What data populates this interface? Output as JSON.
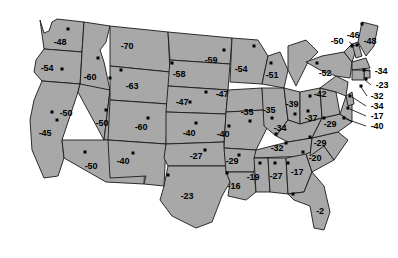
{
  "map": {
    "title": "United States state value map",
    "colors": {
      "state_fill": "#a8a8a8",
      "state_border": "#1a1a1a",
      "label_text": "#000000",
      "background": "#ffffff",
      "marker": "#000000"
    },
    "value_prefix": "",
    "states": [
      {
        "code": "WA",
        "label": "-48",
        "value": -48,
        "lx": 60,
        "ly": 42,
        "dx": 68,
        "dy": 29
      },
      {
        "code": "OR",
        "label": "-54",
        "value": -54,
        "lx": 47,
        "ly": 68,
        "dx": 62,
        "dy": 69
      },
      {
        "code": "ID",
        "label": "-60",
        "value": -60,
        "lx": 90,
        "ly": 77,
        "dx": 98,
        "dy": 58
      },
      {
        "code": "MT",
        "label": "-70",
        "value": -70,
        "lx": 127,
        "ly": 46,
        "dx": 110,
        "dy": 78
      },
      {
        "code": "ND",
        "label": "-59",
        "value": -59,
        "lx": 211,
        "ly": 60,
        "dx": 224,
        "dy": 50
      },
      {
        "code": "MN",
        "label": "-54",
        "value": -54,
        "lx": 241,
        "ly": 69,
        "dx": 254,
        "dy": 46
      },
      {
        "code": "WY",
        "label": "-63",
        "value": -63,
        "lx": 132,
        "ly": 86,
        "dx": 121,
        "dy": 70
      },
      {
        "code": "SD",
        "label": "-58",
        "value": -58,
        "lx": 179,
        "ly": 74,
        "dx": 172,
        "dy": 63
      },
      {
        "code": "NE",
        "label": "-47",
        "value": -47,
        "lx": 182,
        "ly": 102,
        "dx": 190,
        "dy": 102
      },
      {
        "code": "IA",
        "label": "-47",
        "value": -47,
        "lx": 222,
        "ly": 94,
        "dx": 206,
        "dy": 92
      },
      {
        "code": "WI",
        "label": "-51",
        "value": -51,
        "lx": 272,
        "ly": 75,
        "dx": 271,
        "dy": 63
      },
      {
        "code": "MI",
        "label": "-51",
        "value": -51,
        "lx": 272,
        "ly": 75,
        "dx": 271,
        "dy": 63
      },
      {
        "code": "NV",
        "label": "-50",
        "value": -50,
        "lx": 66,
        "ly": 113,
        "dx": 52,
        "dy": 112
      },
      {
        "code": "UT",
        "label": "-50",
        "value": -50,
        "lx": 102,
        "ly": 123,
        "dx": 106,
        "dy": 110
      },
      {
        "code": "CA",
        "label": "-45",
        "value": -45,
        "lx": 45,
        "ly": 133,
        "dx": 57,
        "dy": 120
      },
      {
        "code": "CO",
        "label": "-60",
        "value": -60,
        "lx": 141,
        "ly": 127,
        "dx": 148,
        "dy": 118
      },
      {
        "code": "KS",
        "label": "-40",
        "value": -40,
        "lx": 189,
        "ly": 133,
        "dx": 196,
        "dy": 123
      },
      {
        "code": "MO",
        "label": "-40",
        "value": -40,
        "lx": 223,
        "ly": 134,
        "dx": 229,
        "dy": 126
      },
      {
        "code": "IL",
        "label": "-35",
        "value": -35,
        "lx": 247,
        "ly": 112,
        "dx": 250,
        "dy": 121
      },
      {
        "code": "IN",
        "label": "-35",
        "value": -35,
        "lx": 269,
        "ly": 110,
        "dx": 272,
        "dy": 118
      },
      {
        "code": "OH",
        "label": "-39",
        "value": -39,
        "lx": 292,
        "ly": 104,
        "dx": 295,
        "dy": 114
      },
      {
        "code": "PA",
        "label": "-42",
        "value": -42,
        "lx": 320,
        "ly": 94,
        "dx": 310,
        "dy": 96
      },
      {
        "code": "NY",
        "label": "-52",
        "value": -52,
        "lx": 325,
        "ly": 73,
        "dx": 317,
        "dy": 63
      },
      {
        "code": "VT",
        "label": "-50",
        "value": -50,
        "lx": 337,
        "ly": 41,
        "dx": 352,
        "dy": 46
      },
      {
        "code": "NH",
        "label": "-46",
        "value": -46,
        "lx": 353,
        "ly": 35,
        "dx": 357,
        "dy": 45
      },
      {
        "code": "ME",
        "label": "-48",
        "value": -48,
        "lx": 370,
        "ly": 41,
        "dx": 362,
        "dy": 24
      },
      {
        "code": "MA",
        "label": "-34",
        "value": -34,
        "lx": 381,
        "ly": 71,
        "dx": 364,
        "dy": 70
      },
      {
        "code": "RI",
        "label": "-23",
        "value": -23,
        "lx": 382,
        "ly": 85,
        "dx": 366,
        "dy": 79
      },
      {
        "code": "CT",
        "label": "-32",
        "value": -32,
        "lx": 377,
        "ly": 96,
        "dx": 361,
        "dy": 86
      },
      {
        "code": "NJ",
        "label": "-34",
        "value": -34,
        "lx": 377,
        "ly": 106,
        "dx": 350,
        "dy": 96
      },
      {
        "code": "DE",
        "label": "-17",
        "value": -17,
        "lx": 377,
        "ly": 116,
        "dx": 348,
        "dy": 108
      },
      {
        "code": "MD",
        "label": "-40",
        "value": -40,
        "lx": 377,
        "ly": 126,
        "dx": 344,
        "dy": 118
      },
      {
        "code": "WV",
        "label": "-37",
        "value": -37,
        "lx": 311,
        "ly": 118,
        "dx": 308,
        "dy": 111
      },
      {
        "code": "VA",
        "label": "-29",
        "value": -29,
        "lx": 330,
        "ly": 124,
        "dx": 324,
        "dy": 118
      },
      {
        "code": "KY",
        "label": "-34",
        "value": -34,
        "lx": 280,
        "ly": 128,
        "dx": 276,
        "dy": 134
      },
      {
        "code": "TN",
        "label": "-32",
        "value": -32,
        "lx": 277,
        "ly": 148,
        "dx": 286,
        "dy": 143
      },
      {
        "code": "NC",
        "label": "-29",
        "value": -29,
        "lx": 320,
        "ly": 143,
        "dx": 310,
        "dy": 137
      },
      {
        "code": "SC",
        "label": "-20",
        "value": -20,
        "lx": 315,
        "ly": 158,
        "dx": 303,
        "dy": 152
      },
      {
        "code": "OK",
        "label": "-27",
        "value": -27,
        "lx": 196,
        "ly": 156,
        "dx": 205,
        "dy": 150
      },
      {
        "code": "AR",
        "label": "-29",
        "value": -29,
        "lx": 232,
        "ly": 161,
        "dx": 239,
        "dy": 155
      },
      {
        "code": "MS",
        "label": "-19",
        "value": -19,
        "lx": 253,
        "ly": 177,
        "dx": 260,
        "dy": 163
      },
      {
        "code": "AL",
        "label": "-27",
        "value": -27,
        "lx": 276,
        "ly": 176,
        "dx": 275,
        "dy": 163
      },
      {
        "code": "GA",
        "label": "-17",
        "value": -17,
        "lx": 297,
        "ly": 172,
        "dx": 288,
        "dy": 163
      },
      {
        "code": "LA",
        "label": "-16",
        "value": -16,
        "lx": 234,
        "ly": 186,
        "dx": 227,
        "dy": 173
      },
      {
        "code": "FL",
        "label": "-2",
        "value": -2,
        "lx": 320,
        "ly": 211,
        "dx": 293,
        "dy": 194
      },
      {
        "code": "TX",
        "label": "-23",
        "value": -23,
        "lx": 187,
        "ly": 196,
        "dx": 168,
        "dy": 175
      },
      {
        "code": "NM",
        "label": "-40",
        "value": -40,
        "lx": 123,
        "ly": 161,
        "dx": 133,
        "dy": 153
      },
      {
        "code": "AZ",
        "label": "-50",
        "value": -50,
        "lx": 91,
        "ly": 166,
        "dx": 85,
        "dy": 152
      }
    ],
    "leaders": [
      {
        "x1": 355,
        "y1": 46,
        "x2": 349,
        "y2": 42
      },
      {
        "x1": 370,
        "y1": 71,
        "x2": 363,
        "y2": 70
      },
      {
        "x1": 371,
        "y1": 85,
        "x2": 365,
        "y2": 80
      },
      {
        "x1": 367,
        "y1": 96,
        "x2": 361,
        "y2": 87
      },
      {
        "x1": 366,
        "y1": 106,
        "x2": 352,
        "y2": 97
      },
      {
        "x1": 366,
        "y1": 116,
        "x2": 350,
        "y2": 109
      },
      {
        "x1": 366,
        "y1": 126,
        "x2": 346,
        "y2": 119
      }
    ]
  }
}
